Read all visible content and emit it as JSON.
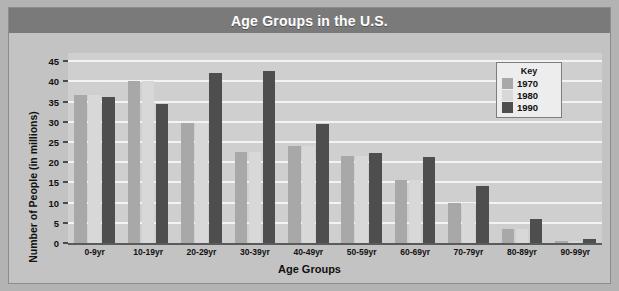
{
  "chart_data": {
    "type": "bar",
    "title": "Age Groups in the U.S.",
    "xlabel": "Age Groups",
    "ylabel": "Number of People (in millions)",
    "categories": [
      "0-9yr",
      "10-19yr",
      "20-29yr",
      "30-39yr",
      "40-49yr",
      "50-59yr",
      "60-69yr",
      "70-79yr",
      "80-89yr",
      "90-99yr"
    ],
    "series": [
      {
        "name": "1970",
        "color": "#a8a8a8",
        "values": [
          36.5,
          40,
          29.8,
          22.5,
          24,
          21.5,
          15.5,
          9.8,
          3.5,
          0.5
        ]
      },
      {
        "name": "1980",
        "color": "#d8d8d8",
        "values": [
          36.5,
          40,
          29.8,
          22.5,
          24,
          21.5,
          15.5,
          9.8,
          3.5,
          0.5
        ]
      },
      {
        "name": "1990",
        "color": "#4e4e4e",
        "values": [
          36,
          34.5,
          42,
          42.5,
          29.5,
          22.3,
          21.3,
          14,
          6,
          1
        ]
      }
    ],
    "ylim": [
      0,
      47
    ],
    "yticks": [
      0,
      5,
      10,
      15,
      20,
      25,
      30,
      35,
      40,
      45
    ],
    "ytick_labels": [
      "0",
      "5",
      "10",
      "15",
      "20",
      "25",
      "30",
      "35",
      "40",
      "45"
    ],
    "grid": true,
    "legend_position": "top-right"
  },
  "legend": {
    "title": "Key",
    "entries": [
      {
        "label": "1970",
        "color": "#a8a8a8"
      },
      {
        "label": "1980",
        "color": "#d8d8d8"
      },
      {
        "label": "1990",
        "color": "#4e4e4e"
      }
    ]
  },
  "colors": {
    "title_bar": "#7a7a7a",
    "title_text": "#ffffff",
    "plot_background": "#cfcfcf",
    "page_background": "#c3c3c3",
    "gridline": "#f3f3f3"
  }
}
